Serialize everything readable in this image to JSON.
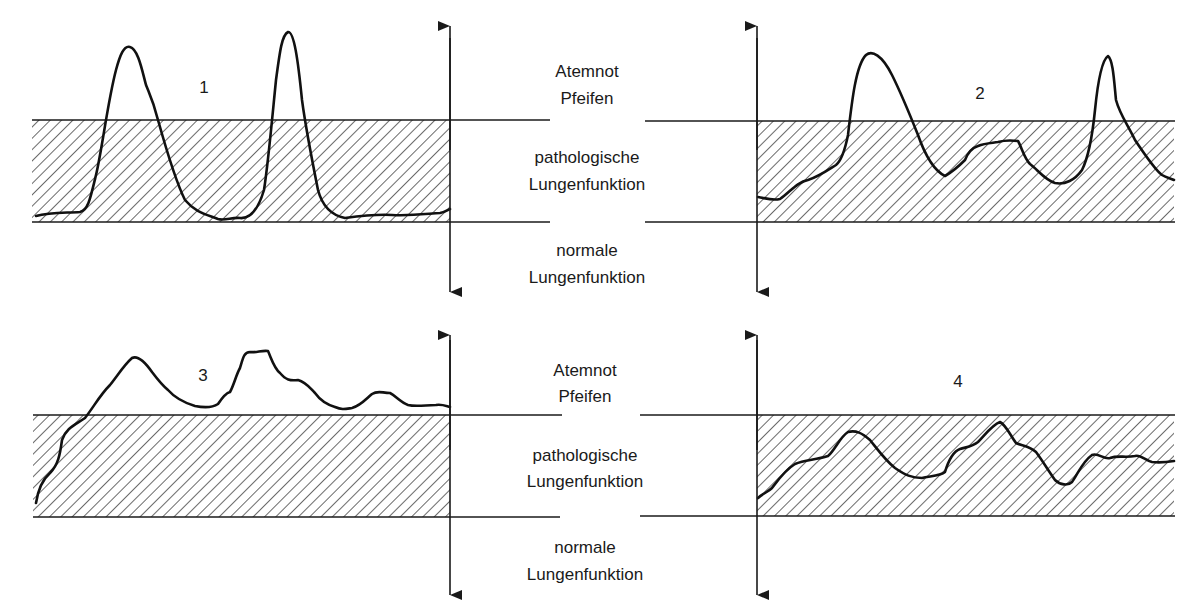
{
  "diagram": {
    "zones": {
      "upper": [
        "Atemnot",
        "Pfeifen"
      ],
      "middle": [
        "pathologische",
        "Lungenfunktion"
      ],
      "lower": [
        "normale",
        "Lungenfunktion"
      ]
    },
    "panels": [
      {
        "id": "1",
        "label": "1"
      },
      {
        "id": "2",
        "label": "2"
      },
      {
        "id": "3",
        "label": "3"
      },
      {
        "id": "4",
        "label": "4"
      }
    ],
    "colors": {
      "ink": "#1a1a1a",
      "background": "#ffffff"
    }
  }
}
